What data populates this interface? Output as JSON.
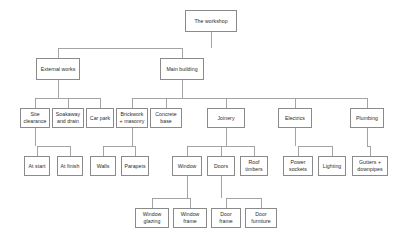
{
  "diagram": {
    "type": "tree",
    "box_border_color": "#8a8a8a",
    "line_color": "#9a9a9a",
    "background_color": "#ffffff",
    "text_color": "#2b2b2b",
    "levels": 5,
    "nodes": [
      {
        "id": "root",
        "label": "The workshop",
        "x": 185,
        "y": 10,
        "w": 52,
        "h": 22,
        "level": 0,
        "parent": null
      },
      {
        "id": "external",
        "label": "External works",
        "x": 36,
        "y": 58,
        "w": 44,
        "h": 22,
        "level": 1,
        "parent": "root"
      },
      {
        "id": "mainbuild",
        "label": "Main building",
        "x": 160,
        "y": 58,
        "w": 44,
        "h": 22,
        "level": 1,
        "parent": "root"
      },
      {
        "id": "siteclear",
        "label": "Site clearance",
        "x": 20,
        "y": 108,
        "w": 30,
        "h": 20,
        "level": 2,
        "parent": "external"
      },
      {
        "id": "soakaway",
        "label": "Soakaway and drain",
        "x": 52,
        "y": 108,
        "w": 32,
        "h": 20,
        "level": 2,
        "parent": "external"
      },
      {
        "id": "carpark",
        "label": "Car park",
        "x": 86,
        "y": 108,
        "w": 28,
        "h": 20,
        "level": 2,
        "parent": "external"
      },
      {
        "id": "brickwork",
        "label": "Brickwork + masonry",
        "x": 116,
        "y": 108,
        "w": 32,
        "h": 20,
        "level": 2,
        "parent": "mainbuild"
      },
      {
        "id": "concrete",
        "label": "Concrete base",
        "x": 150,
        "y": 108,
        "w": 32,
        "h": 20,
        "level": 2,
        "parent": "mainbuild"
      },
      {
        "id": "joinery",
        "label": "Joinery",
        "x": 207,
        "y": 108,
        "w": 38,
        "h": 20,
        "level": 2,
        "parent": "mainbuild"
      },
      {
        "id": "electrics",
        "label": "Electrics",
        "x": 278,
        "y": 108,
        "w": 34,
        "h": 20,
        "level": 2,
        "parent": "mainbuild"
      },
      {
        "id": "plumbing",
        "label": "Plumbing",
        "x": 350,
        "y": 108,
        "w": 34,
        "h": 20,
        "level": 2,
        "parent": "mainbuild"
      },
      {
        "id": "atstart",
        "label": "At start",
        "x": 24,
        "y": 156,
        "w": 26,
        "h": 20,
        "level": 3,
        "parent": "siteclear"
      },
      {
        "id": "atfinish",
        "label": "At finish",
        "x": 57,
        "y": 156,
        "w": 26,
        "h": 20,
        "level": 3,
        "parent": "siteclear"
      },
      {
        "id": "walls",
        "label": "Walls",
        "x": 90,
        "y": 156,
        "w": 26,
        "h": 20,
        "level": 3,
        "parent": "brickwork"
      },
      {
        "id": "parapets",
        "label": "Parapets",
        "x": 121,
        "y": 156,
        "w": 28,
        "h": 20,
        "level": 3,
        "parent": "brickwork"
      },
      {
        "id": "window",
        "label": "Window",
        "x": 172,
        "y": 156,
        "w": 30,
        "h": 20,
        "level": 3,
        "parent": "joinery"
      },
      {
        "id": "doors",
        "label": "Doors",
        "x": 207,
        "y": 156,
        "w": 28,
        "h": 20,
        "level": 3,
        "parent": "joinery"
      },
      {
        "id": "rooftimbers",
        "label": "Roof timbers",
        "x": 240,
        "y": 156,
        "w": 28,
        "h": 20,
        "level": 3,
        "parent": "joinery"
      },
      {
        "id": "powersock",
        "label": "Power sockets",
        "x": 283,
        "y": 156,
        "w": 30,
        "h": 20,
        "level": 3,
        "parent": "electrics"
      },
      {
        "id": "lighting",
        "label": "Lighting",
        "x": 318,
        "y": 156,
        "w": 28,
        "h": 20,
        "level": 3,
        "parent": "electrics"
      },
      {
        "id": "gutters",
        "label": "Gutters + downpipes",
        "x": 352,
        "y": 156,
        "w": 36,
        "h": 20,
        "level": 3,
        "parent": "plumbing"
      },
      {
        "id": "winglazing",
        "label": "Window glazing",
        "x": 135,
        "y": 208,
        "w": 34,
        "h": 20,
        "level": 4,
        "parent": "window"
      },
      {
        "id": "winframe",
        "label": "Window frame",
        "x": 173,
        "y": 208,
        "w": 34,
        "h": 20,
        "level": 4,
        "parent": "window"
      },
      {
        "id": "doorframe",
        "label": "Door frame",
        "x": 211,
        "y": 208,
        "w": 30,
        "h": 20,
        "level": 4,
        "parent": "doors"
      },
      {
        "id": "doorfurn",
        "label": "Door furniture",
        "x": 245,
        "y": 208,
        "w": 32,
        "h": 20,
        "level": 4,
        "parent": "doors"
      }
    ]
  }
}
